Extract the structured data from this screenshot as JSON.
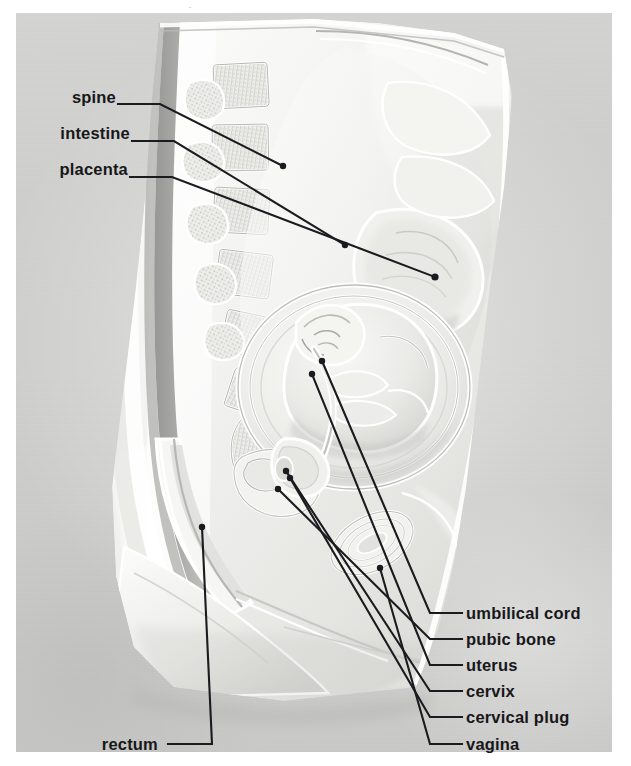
{
  "figure": {
    "kind": "anatomical-relief-photograph",
    "plate_background_color": "#cfcfcd",
    "page_background_color": "#ffffff",
    "label_text_color": "#17171a",
    "leader_line_color": "#1b1b1f",
    "cropped_top_text": "."
  },
  "labels": {
    "left": [
      {
        "id": "spine",
        "text": "spine",
        "text_x": 60,
        "text_y": 97,
        "elbow": [
          118,
          104
        ],
        "bend": [
          160,
          104
        ],
        "tip": [
          283,
          166
        ]
      },
      {
        "id": "intestine",
        "text": "intestine",
        "text_x": 41,
        "text_y": 133,
        "elbow": [
          132,
          141
        ],
        "bend": [
          174,
          141
        ],
        "tip": [
          345,
          245
        ]
      },
      {
        "id": "placenta",
        "text": "placenta",
        "text_x": 41,
        "text_y": 169,
        "elbow": [
          130,
          177
        ],
        "bend": [
          172,
          177
        ],
        "tip": [
          435,
          277
        ]
      }
    ],
    "right": [
      {
        "id": "umbilical-cord",
        "text": "umbilical cord",
        "text_x": 466,
        "text_y": 606,
        "elbow": [
          462,
          613
        ],
        "bend": [
          430,
          613
        ],
        "tip": [
          322,
          361
        ]
      },
      {
        "id": "pubic-bone",
        "text": "pubic bone",
        "text_x": 466,
        "text_y": 632,
        "elbow": [
          462,
          639
        ],
        "bend": [
          430,
          639
        ],
        "tip": [
          278,
          489
        ]
      },
      {
        "id": "uterus",
        "text": "uterus",
        "text_x": 466,
        "text_y": 658,
        "elbow": [
          462,
          665
        ],
        "bend": [
          430,
          665
        ],
        "tip": [
          312,
          374
        ]
      },
      {
        "id": "cervix",
        "text": "cervix",
        "text_x": 466,
        "text_y": 684,
        "elbow": [
          462,
          691
        ],
        "bend": [
          430,
          691
        ],
        "tip": [
          286,
          471
        ]
      },
      {
        "id": "cervical-plug",
        "text": "cervical plug",
        "text_x": 466,
        "text_y": 710,
        "elbow": [
          462,
          717
        ],
        "bend": [
          430,
          717
        ],
        "tip": [
          290,
          478
        ]
      },
      {
        "id": "vagina",
        "text": "vagina",
        "text_x": 466,
        "text_y": 737,
        "elbow": [
          462,
          744
        ],
        "bend": [
          430,
          744
        ],
        "tip": [
          380,
          568
        ]
      }
    ],
    "bottom_left": [
      {
        "id": "rectum",
        "text": "rectum",
        "text_x": 97,
        "text_y": 737,
        "elbow": [
          168,
          744
        ],
        "bend": [
          212,
          744
        ],
        "tip": [
          202,
          527
        ]
      }
    ]
  }
}
